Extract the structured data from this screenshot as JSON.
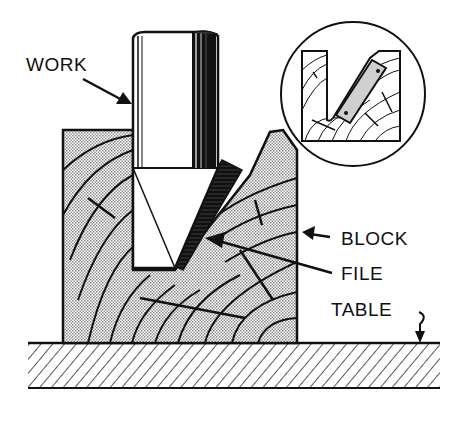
{
  "figure": {
    "labels": {
      "work": "WORK",
      "block": "BLOCK",
      "file": "FILE",
      "table": "TABLE"
    },
    "colors": {
      "ink": "#111111",
      "stipple": "#bdbdbd",
      "background": "#ffffff"
    }
  }
}
